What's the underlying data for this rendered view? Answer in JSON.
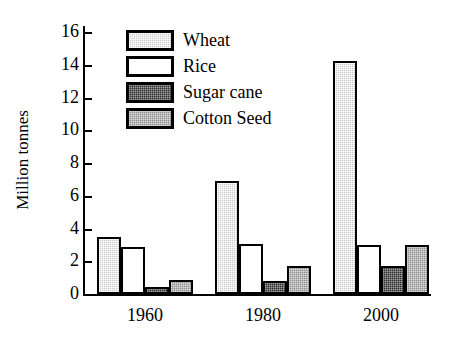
{
  "chart_data": {
    "type": "bar",
    "title": "",
    "subtitle": "",
    "xlabel": "",
    "ylabel": "Million tonnes",
    "categories": [
      "1960",
      "1980",
      "2000"
    ],
    "ylim": [
      0,
      16
    ],
    "yticks": [
      0,
      2,
      4,
      6,
      8,
      10,
      12,
      14,
      16
    ],
    "ytick_labels": [
      "0",
      "2",
      "4",
      "6",
      "8",
      "10",
      "12",
      "14",
      "16"
    ],
    "grid": false,
    "legend_position": "top-left-inside",
    "series": [
      {
        "name": "Wheat",
        "values": [
          3.5,
          6.9,
          14.2
        ],
        "color": "#c9c9c9",
        "pattern": "light-dotted"
      },
      {
        "name": "Rice",
        "values": [
          2.85,
          3.05,
          3.0
        ],
        "color": "#ffffff",
        "pattern": "solid-white"
      },
      {
        "name": "Sugar cane",
        "values": [
          0.4,
          0.8,
          1.7
        ],
        "color": "#2e2e2e",
        "pattern": "dark-dotted"
      },
      {
        "name": "Cotton Seed",
        "values": [
          0.85,
          1.7,
          3.0
        ],
        "color": "#8f8f8f",
        "pattern": "mid-dotted"
      }
    ]
  },
  "axis": {
    "y_title": "Million tonnes"
  },
  "legend": {
    "items": [
      {
        "label": "Wheat"
      },
      {
        "label": "Rice"
      },
      {
        "label": "Sugar cane"
      },
      {
        "label": "Cotton Seed"
      }
    ]
  }
}
